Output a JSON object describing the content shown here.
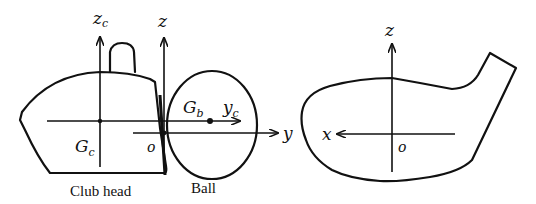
{
  "figure": {
    "left_panel": {
      "caption_club": "Club head",
      "caption_ball": "Ball",
      "labels": {
        "zc_main": "z",
        "zc_sub": "c",
        "z": "z",
        "gc_main": "G",
        "gc_sub": "c",
        "gb_main": "G",
        "gb_sub": "b",
        "yc_main": "y",
        "yc_sub": "c",
        "origin": "o",
        "y": "y"
      }
    },
    "right_panel": {
      "labels": {
        "z": "z",
        "x": "x",
        "origin": "o"
      }
    }
  }
}
